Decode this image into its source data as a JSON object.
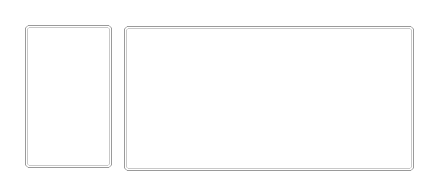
{
  "canvas": {
    "width": 437,
    "height": 190,
    "background": "#ffffff"
  },
  "boxes": [
    {
      "id": "left-panel",
      "x": 25,
      "y": 25,
      "width": 87,
      "height": 143,
      "stroke_outer": "#9a9a9a",
      "stroke_inner": "#c8c8c8",
      "fill": "#ffffff",
      "label": ""
    },
    {
      "id": "right-panel",
      "x": 124,
      "y": 26,
      "width": 290,
      "height": 145,
      "stroke_outer": "#9a9a9a",
      "stroke_inner": "#c8c8c8",
      "fill": "#ffffff",
      "label": ""
    }
  ]
}
